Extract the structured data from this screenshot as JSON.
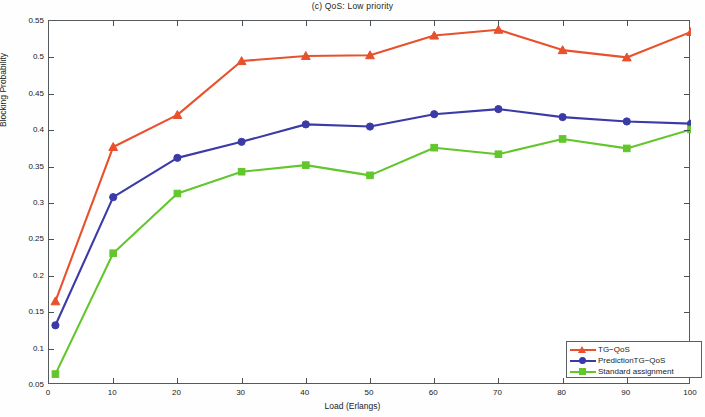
{
  "chart_data": {
    "type": "line",
    "title": "(c) QoS: Low priority",
    "xlabel": "Load (Erlangs)",
    "ylabel": "Blocking Probability",
    "xlim": [
      0,
      100
    ],
    "ylim": [
      0.05,
      0.55
    ],
    "xticks": [
      0,
      10,
      20,
      30,
      40,
      50,
      60,
      70,
      80,
      90,
      100
    ],
    "xtick_labels": [
      "0",
      "10",
      "20",
      "30",
      "40",
      "50",
      "60",
      "70",
      "80",
      "90",
      "100"
    ],
    "yticks": [
      0.05,
      0.1,
      0.15,
      0.2,
      0.25,
      0.3,
      0.35,
      0.4,
      0.45,
      0.5,
      0.55
    ],
    "ytick_labels": [
      "0.05",
      "0.1",
      "0.15",
      "0.2",
      "0.25",
      "0.3",
      "0.35",
      "0.4",
      "0.45",
      "0.5",
      "0.55"
    ],
    "grid": false,
    "legend_position": "lower right",
    "x": [
      1,
      10,
      20,
      30,
      40,
      50,
      60,
      70,
      80,
      90,
      100
    ],
    "series": [
      {
        "name": "TG-QoS",
        "color": "#e8512c",
        "marker": "triangle",
        "values": [
          0.165,
          0.377,
          0.421,
          0.495,
          0.502,
          0.503,
          0.53,
          0.538,
          0.51,
          0.5,
          0.535
        ]
      },
      {
        "name": "PredictionTG-QoS",
        "color": "#3b3ba8",
        "marker": "circle",
        "values": [
          0.132,
          0.308,
          0.362,
          0.384,
          0.408,
          0.405,
          0.422,
          0.429,
          0.418,
          0.412,
          0.409
        ]
      },
      {
        "name": "Standard assignment",
        "color": "#62c62c",
        "marker": "square",
        "values": [
          0.065,
          0.231,
          0.313,
          0.343,
          0.352,
          0.338,
          0.376,
          0.367,
          0.388,
          0.375,
          0.401
        ]
      }
    ]
  },
  "legend": {
    "items": [
      {
        "label": "TG−QoS",
        "color": "#e8512c",
        "marker": "triangle"
      },
      {
        "label": "PredictionTG−QoS",
        "color": "#3b3ba8",
        "marker": "circle"
      },
      {
        "label": "Standard assignment",
        "color": "#62c62c",
        "marker": "square"
      }
    ]
  }
}
